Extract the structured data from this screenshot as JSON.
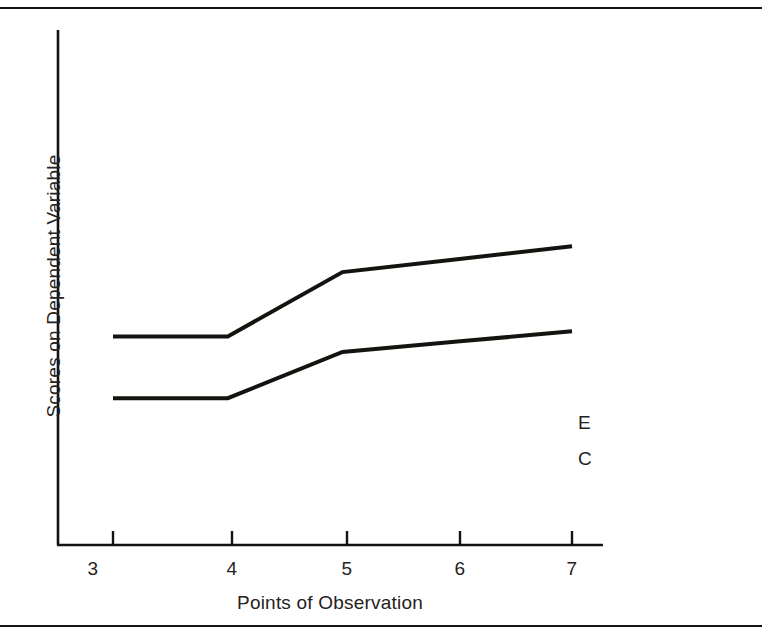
{
  "figure": {
    "background_color": "#ffffff",
    "ink_color": "#15130f",
    "has_top_rule": true,
    "has_bottom_rule": true
  },
  "chart_data": {
    "type": "line",
    "title": "",
    "subtitle": "",
    "xlabel": "Points of Observation",
    "ylabel": "Scores on Dependent Variable",
    "x": [
      3,
      4,
      5,
      6,
      7
    ],
    "xtick_labels": [
      "3",
      "4",
      "5",
      "6",
      "7"
    ],
    "ytick_labels": [],
    "xlim": [
      2.8,
      7.3
    ],
    "ylim": [
      0,
      10
    ],
    "grid": false,
    "legend_position": "right-of-line-ends",
    "annotations": [
      "E",
      "C"
    ],
    "series": [
      {
        "name": "E",
        "label": "E",
        "description": "Experimental group",
        "color": "#15130f",
        "line_width": 4,
        "values": [
          4.05,
          4.05,
          5.3,
          5.55,
          5.8
        ]
      },
      {
        "name": "C",
        "label": "C",
        "description": "Control group",
        "color": "#15130f",
        "line_width": 4,
        "values": [
          2.85,
          2.85,
          3.75,
          3.95,
          4.15
        ]
      }
    ]
  },
  "axes": {
    "x_ticks": [
      "3",
      "4",
      "5",
      "6",
      "7"
    ],
    "x_title": "Points of Observation",
    "y_title": "Scores on Dependent Variable"
  },
  "series_labels": {
    "experimental": "E",
    "control": "C"
  }
}
